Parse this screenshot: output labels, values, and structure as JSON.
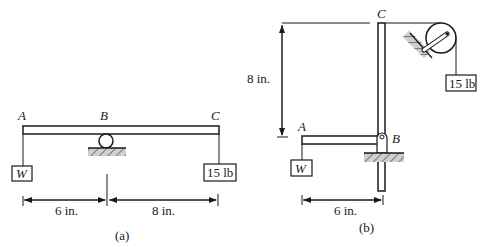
{
  "figure_a": {
    "points": {
      "A": "A",
      "B": "B",
      "C": "C"
    },
    "left_weight": "W",
    "right_weight": "15 lb",
    "dim_left": "6 in.",
    "dim_right": "8 in.",
    "caption": "(a)"
  },
  "figure_b": {
    "points": {
      "A": "A",
      "B": "B",
      "C": "C"
    },
    "left_weight": "W",
    "pulley_weight": "15 lb",
    "dim_vertical": "8 in.",
    "dim_horizontal": "6 in.",
    "caption": "(b)"
  }
}
